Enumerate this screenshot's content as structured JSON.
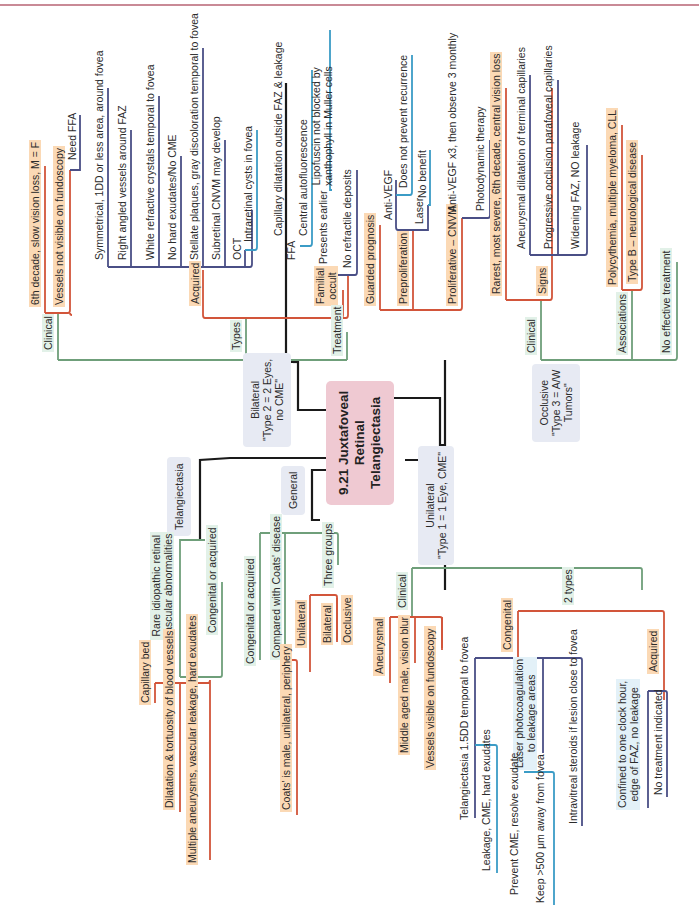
{
  "page": {
    "orientation": "rotated -90deg (landscape mind map)",
    "colors": {
      "central": "#efc9d2",
      "category_box": "#e7eaf3",
      "orange_branch": "#d2553a",
      "green_branch": "#6f9f7a",
      "navy_branch": "#4a4f86",
      "blue_branch": "#3b9cc6",
      "trunk": "#1a1a1a",
      "orange_label": "#fbd9b5",
      "green_label": "#e2f1e8",
      "blue_label": "#e3f1f8"
    }
  },
  "central": {
    "title": "9.21 Juxtafoveal\nRetinal\nTelangiectasia"
  },
  "bilateral": {
    "label": "Bilateral\n\"Type 2 = 2 Eyes,\nno CME\"",
    "clinical": {
      "label": "Clinical",
      "items": [
        "6th decade, slow vision loss, M = F",
        "Vessels not visible on fundoscopy"
      ],
      "need_ffa": "Need FFA"
    },
    "types": {
      "label": "Types",
      "acquired": {
        "label": "Acquired",
        "items": [
          "Symmetrical, 1DD or less area, around fovea",
          "Right angled vessels around FAZ",
          "White refractive crystals temporal to fovea",
          "No hard exudates/No CME",
          "Stellate plaques, gray discoloration temporal to fovea",
          "Subretinal CNVM may develop"
        ],
        "oct": {
          "label": "OCT",
          "detail": "Intraretinal cysts in fovea"
        },
        "ffa": {
          "label": "FFA",
          "detail": "Capillary dilatation outside FAZ & leakage",
          "autofluorescence": "Central autofluorescence",
          "lipofuscin": "Lipofuscin not blocked by\nxanthophyll in Muller cells"
        }
      },
      "familial_occult": {
        "label": "Familial\noccult",
        "items": [
          "Presents earlier",
          "No refractile deposits"
        ]
      }
    },
    "treatment": {
      "label": "Treatment",
      "items": [
        "Guarded prognosis"
      ],
      "preproliferation": {
        "label": "Preproliferation",
        "anti_vegf": {
          "label": "Anti-VEGF",
          "detail": "Does not prevent recurrence"
        },
        "laser": {
          "label": "Laser",
          "detail": "No benefit"
        }
      },
      "proliferative": {
        "label": "Proliferative – CNVM",
        "items": [
          "Anti-VEGF x3, then observe 3 monthly",
          "Photodynamic therapy"
        ]
      }
    }
  },
  "occlusive": {
    "label": "Occlusive\n\"Type 3 = A/W\nTumors\"",
    "clinical": {
      "label": "Clinical",
      "items": [
        "Rarest, most severe, 6th decade, central vision loss"
      ],
      "signs": {
        "label": "Signs",
        "items": [
          "Aneurysmal dilatation of terminal capillaries",
          "Progressive occlusion parafoveal capillaries",
          "Widening FAZ, NO leakage"
        ]
      }
    },
    "associations": {
      "label": "Associations",
      "items": [
        "Polycythemia, multiple myeloma, CLL",
        "Type B – neurological disease"
      ]
    },
    "treatment": "No effective treatment"
  },
  "telangiectasia": {
    "label": "Telangiectasia",
    "definition": "Rare idiopathic retinal\nvascular abnormalities",
    "congenital_or_acquired": "Congenital or acquired",
    "items": [
      "Capillary bed",
      "Dilatation & tortuosity of blood vessels",
      "Multiple aneurysms, vascular leakage, hard exudates"
    ]
  },
  "general": {
    "label": "General",
    "congenital_or_acquired": "Congenital or acquired",
    "coats": {
      "label": "Compared with Coats' disease",
      "detail": "Coats' is male, unilateral, periphery"
    },
    "three_groups": {
      "label": "Three groups",
      "items": [
        "Unilateral",
        "Bilateral",
        "Occlusive"
      ]
    }
  },
  "unilateral": {
    "label": "Unilateral\n\"Type 1 = 1 Eye, CME\"",
    "clinical": {
      "label": "Clinical",
      "aneurysmal": "Aneurysmal",
      "items": [
        "Middle aged male, vision blur",
        "Vessels visible on fundoscopy"
      ]
    },
    "two_types": {
      "label": "2 types",
      "congenital": {
        "label": "Congenital",
        "telangiectasia": {
          "label": "Telangiectasia 1.5DD temporal to fovea",
          "detail": "Leakage, CME, hard exudates"
        },
        "laser": {
          "label": "Laser photocoagulation\nto leakage areas",
          "items": [
            "Prevent CME, resolve exudate",
            "Keep >500 μm away from fovea"
          ]
        },
        "steroids": "Intravitreal steroids if lesion close to fovea"
      },
      "acquired": {
        "label": "Acquired",
        "detail": "Confined to one clock hour,\nedge of FAZ, no leakage",
        "treatment": "No treatment indicated"
      }
    }
  }
}
